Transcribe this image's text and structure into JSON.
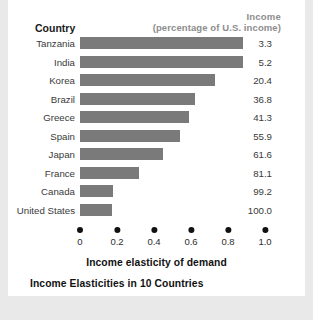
{
  "card": {
    "caption": "Income Elasticities in 10 Countries",
    "country_header": "Country",
    "income_header_line1": "Income",
    "income_header_line2": "(percentage of U.S. income)"
  },
  "chart_data": {
    "type": "bar",
    "orientation": "horizontal",
    "title": "Income Elasticities in 10 Countries",
    "xlabel": "Income elasticity of demand",
    "ylabel": "Country",
    "xlim": [
      0,
      1.0
    ],
    "xticks": [
      "0",
      "0.2",
      "0.4",
      "0.6",
      "0.8",
      "1.0"
    ],
    "xtick_values": [
      0,
      0.2,
      0.4,
      0.6,
      0.8,
      1.0
    ],
    "grid": false,
    "legend": false,
    "bar_color": "#7a7a7a",
    "categories": [
      "Tanzania",
      "India",
      "Korea",
      "Brazil",
      "Greece",
      "Spain",
      "Japan",
      "France",
      "Canada",
      "United States"
    ],
    "values": [
      0.88,
      0.88,
      0.73,
      0.62,
      0.59,
      0.54,
      0.45,
      0.32,
      0.18,
      0.17
    ],
    "secondary_column": {
      "name": "Income (percentage of U.S. income)",
      "values": [
        "3.3",
        "5.2",
        "20.4",
        "36.8",
        "41.3",
        "55.9",
        "61.6",
        "81.1",
        "99.2",
        "100.0"
      ]
    },
    "rows": [
      {
        "country": "Tanzania",
        "elasticity": 0.88,
        "income": "3.3"
      },
      {
        "country": "India",
        "elasticity": 0.88,
        "income": "5.2"
      },
      {
        "country": "Korea",
        "elasticity": 0.73,
        "income": "20.4"
      },
      {
        "country": "Brazil",
        "elasticity": 0.62,
        "income": "36.8"
      },
      {
        "country": "Greece",
        "elasticity": 0.59,
        "income": "41.3"
      },
      {
        "country": "Spain",
        "elasticity": 0.54,
        "income": "55.9"
      },
      {
        "country": "Japan",
        "elasticity": 0.45,
        "income": "61.6"
      },
      {
        "country": "France",
        "elasticity": 0.32,
        "income": "81.1"
      },
      {
        "country": "Canada",
        "elasticity": 0.18,
        "income": "99.2"
      },
      {
        "country": "United States",
        "elasticity": 0.17,
        "income": "100.0"
      }
    ]
  }
}
